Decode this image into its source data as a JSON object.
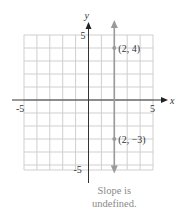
{
  "chart_data": {
    "type": "line",
    "title": "",
    "xlabel": "x",
    "ylabel": "y",
    "xlim": [
      -5,
      5
    ],
    "ylim": [
      -5,
      5
    ],
    "grid": true,
    "x_ticks": [
      "-5",
      "5"
    ],
    "y_ticks": [
      "5",
      "-5"
    ],
    "series": [
      {
        "name": "vertical line x = 2",
        "x": [
          2,
          2
        ],
        "y": [
          -5.5,
          6
        ],
        "color": "#9a9a9a"
      }
    ],
    "points": [
      {
        "x": 2,
        "y": 4,
        "label": "(2, 4)"
      },
      {
        "x": 2,
        "y": -3,
        "label": "(2, −3)"
      }
    ],
    "annotation": [
      "Slope is",
      "undefined."
    ]
  }
}
